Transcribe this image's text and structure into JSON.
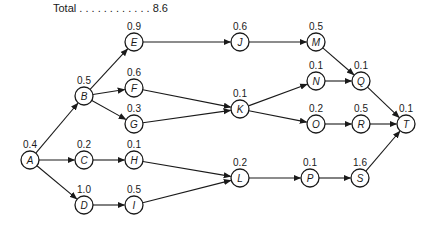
{
  "total": {
    "label": "Total",
    "dots": " . . . . . . . . . . . . ",
    "value": "8.6"
  },
  "nodes": [
    {
      "id": "A",
      "value": "0.4",
      "x": 30,
      "y": 160
    },
    {
      "id": "B",
      "value": "0.5",
      "x": 84,
      "y": 96
    },
    {
      "id": "C",
      "value": "0.2",
      "x": 84,
      "y": 160
    },
    {
      "id": "D",
      "value": "1.0",
      "x": 84,
      "y": 205
    },
    {
      "id": "E",
      "value": "0.9",
      "x": 134,
      "y": 42
    },
    {
      "id": "F",
      "value": "0.6",
      "x": 134,
      "y": 88
    },
    {
      "id": "G",
      "value": "0.3",
      "x": 134,
      "y": 124
    },
    {
      "id": "H",
      "value": "0.1",
      "x": 134,
      "y": 160
    },
    {
      "id": "I",
      "value": "0.5",
      "x": 134,
      "y": 205
    },
    {
      "id": "J",
      "value": "0.6",
      "x": 240,
      "y": 42
    },
    {
      "id": "K",
      "value": "0.1",
      "x": 240,
      "y": 109
    },
    {
      "id": "L",
      "value": "0.2",
      "x": 240,
      "y": 178
    },
    {
      "id": "M",
      "value": "0.5",
      "x": 316,
      "y": 42
    },
    {
      "id": "N",
      "value": "0.1",
      "x": 316,
      "y": 81
    },
    {
      "id": "O",
      "value": "0.2",
      "x": 316,
      "y": 124
    },
    {
      "id": "P",
      "value": "0.1",
      "x": 310,
      "y": 178
    },
    {
      "id": "Q",
      "value": "0.1",
      "x": 361,
      "y": 81
    },
    {
      "id": "R",
      "value": "0.5",
      "x": 361,
      "y": 124
    },
    {
      "id": "S",
      "value": "1.6",
      "x": 360,
      "y": 178
    },
    {
      "id": "T",
      "value": "0.1",
      "x": 406,
      "y": 124
    }
  ],
  "edges": [
    [
      "A",
      "B"
    ],
    [
      "A",
      "C"
    ],
    [
      "A",
      "D"
    ],
    [
      "B",
      "E"
    ],
    [
      "B",
      "F"
    ],
    [
      "B",
      "G"
    ],
    [
      "C",
      "H"
    ],
    [
      "D",
      "I"
    ],
    [
      "E",
      "J"
    ],
    [
      "F",
      "K"
    ],
    [
      "G",
      "K"
    ],
    [
      "H",
      "L"
    ],
    [
      "I",
      "L"
    ],
    [
      "J",
      "M"
    ],
    [
      "K",
      "N"
    ],
    [
      "K",
      "O"
    ],
    [
      "L",
      "P"
    ],
    [
      "M",
      "Q"
    ],
    [
      "N",
      "Q"
    ],
    [
      "O",
      "R"
    ],
    [
      "P",
      "S"
    ],
    [
      "Q",
      "T"
    ],
    [
      "R",
      "T"
    ],
    [
      "S",
      "T"
    ]
  ]
}
